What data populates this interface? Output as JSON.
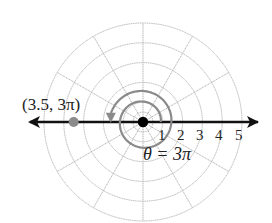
{
  "diagram": {
    "type": "polar-grid",
    "center": {
      "x": 143,
      "y": 122
    },
    "unit_px": 19.8,
    "max_radius": 5,
    "ring_radii": [
      0.5,
      1,
      2,
      3,
      4,
      5
    ],
    "spoke_step_deg": 30,
    "axis_tick_labels": [
      "1",
      "2",
      "3",
      "4",
      "5"
    ],
    "point": {
      "label": "(3.5, 3π)",
      "r": 3.5,
      "theta": "3π",
      "color": "#8c8c8c"
    },
    "angle_label": "θ = 3π",
    "spiral_color": "#8a8a8a",
    "grid_color": "#b4b4b4",
    "axis_color": "#111111",
    "origin_color": "#000000"
  }
}
